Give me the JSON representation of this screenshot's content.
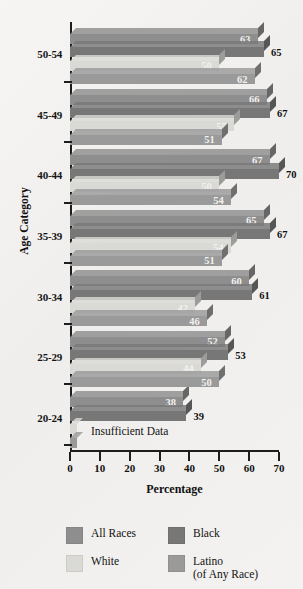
{
  "chart_data": {
    "type": "bar",
    "orientation": "horizontal",
    "title": "",
    "xlabel": "Percentage",
    "ylabel": "Age Category",
    "xlim": [
      0,
      70
    ],
    "xticks": [
      0,
      10,
      20,
      30,
      40,
      50,
      60,
      70
    ],
    "grid": false,
    "legend_position": "bottom",
    "categories": [
      "20-24",
      "25-29",
      "30-34",
      "35-39",
      "40-44",
      "45-49",
      "50-54"
    ],
    "series": [
      {
        "name": "All Races",
        "color": "#8e8e8e",
        "values": [
          38,
          52,
          60,
          65,
          67,
          66,
          63
        ]
      },
      {
        "name": "Black",
        "color": "#777777",
        "values": [
          39,
          53,
          61,
          67,
          70,
          67,
          65
        ]
      },
      {
        "name": "White",
        "color": "#d9d9d6",
        "values": [
          null,
          44,
          42,
          54,
          50,
          55,
          50
        ]
      },
      {
        "name": "Latino (of Any Race)",
        "color": "#9a9a9a",
        "values": [
          null,
          50,
          46,
          51,
          54,
          51,
          62
        ]
      }
    ],
    "annotations": [
      {
        "text": "Insufficient Data",
        "category": "20-24",
        "note": "White and Latino series have no data for ages 20-24"
      }
    ]
  },
  "axes": {
    "x_title": "Percentage",
    "y_title": "Age Category",
    "x_tick_labels": [
      "0",
      "10",
      "20",
      "30",
      "40",
      "50",
      "60",
      "70"
    ],
    "y_tick_labels": [
      "50-54",
      "45-49",
      "40-44",
      "35-39",
      "30-34",
      "25-29",
      "20-24"
    ]
  },
  "legend": {
    "items": [
      {
        "label": "All Races",
        "sublabel": "",
        "color": "#8e8e8e"
      },
      {
        "label": "Black",
        "sublabel": "",
        "color": "#777777"
      },
      {
        "label": "White",
        "sublabel": "",
        "color": "#d9d9d6"
      },
      {
        "label": "Latino",
        "sublabel": "(of Any Race)",
        "color": "#9a9a9a"
      }
    ]
  },
  "notes": {
    "insufficient_data": "Insufficient Data"
  }
}
